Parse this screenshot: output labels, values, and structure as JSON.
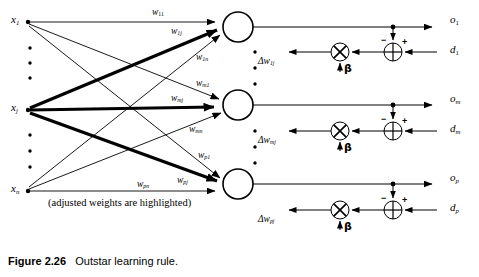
{
  "figure": {
    "number": "Figure 2.26",
    "title": "Outstar learning rule.",
    "note": "(adjusted weights are highlighted)"
  },
  "inputs": [
    {
      "name": "x1",
      "base": "x",
      "sub": "1",
      "x": 14,
      "y": 16
    },
    {
      "name": "xj",
      "base": "x",
      "sub": "j",
      "x": 14,
      "y": 104
    },
    {
      "name": "xn",
      "base": "x",
      "sub": "n",
      "x": 14,
      "y": 185
    }
  ],
  "neurons": [
    {
      "name": "neuron-1",
      "cx": 238,
      "cy": 27,
      "r": 15
    },
    {
      "name": "neuron-m",
      "cx": 238,
      "cy": 105,
      "r": 15
    },
    {
      "name": "neuron-p",
      "cx": 238,
      "cy": 184,
      "r": 15
    }
  ],
  "weights": [
    {
      "name": "w11",
      "base": "w",
      "sub": "11",
      "x": 152,
      "y": 10
    },
    {
      "name": "w1j",
      "base": "w",
      "sub": "1j",
      "x": 172,
      "y": 28
    },
    {
      "name": "w1n",
      "base": "w",
      "sub": "1n",
      "x": 196,
      "y": 54
    },
    {
      "name": "wm1",
      "base": "w",
      "sub": "m1",
      "x": 196,
      "y": 80
    },
    {
      "name": "wmj",
      "base": "w",
      "sub": "mj",
      "x": 172,
      "y": 95
    },
    {
      "name": "wmn",
      "base": "w",
      "sub": "mn",
      "x": 190,
      "y": 126
    },
    {
      "name": "wp1",
      "base": "w",
      "sub": "p1",
      "x": 198,
      "y": 152
    },
    {
      "name": "wpj",
      "base": "w",
      "sub": "pj",
      "x": 178,
      "y": 177
    },
    {
      "name": "wpn",
      "base": "w",
      "sub": "pn",
      "x": 138,
      "y": 181
    }
  ],
  "outputs": [
    {
      "name": "o1",
      "base": "o",
      "sub": "1",
      "x": 452,
      "y": 16
    },
    {
      "name": "om",
      "base": "o",
      "sub": "m",
      "x": 452,
      "y": 95
    },
    {
      "name": "op",
      "base": "o",
      "sub": "p",
      "x": 452,
      "y": 174
    }
  ],
  "desired": [
    {
      "name": "d1",
      "base": "d",
      "sub": "1",
      "x": 452,
      "y": 44
    },
    {
      "name": "dm",
      "base": "d",
      "sub": "m",
      "x": 452,
      "y": 123
    },
    {
      "name": "dp",
      "base": "d",
      "sub": "p",
      "x": 452,
      "y": 202
    }
  ],
  "delta_weights": [
    {
      "name": "dw1j",
      "prefix": "Δw",
      "sub": "1j",
      "x": 265,
      "y": 58
    },
    {
      "name": "dwmj",
      "prefix": "Δw",
      "sub": "mj",
      "x": 265,
      "y": 137
    },
    {
      "name": "dwpj",
      "prefix": "Δw",
      "sub": "pj",
      "x": 265,
      "y": 216
    }
  ],
  "learning_rates": [
    {
      "name": "beta-1",
      "symbol": "β",
      "x": 344,
      "y": 64
    },
    {
      "name": "beta-m",
      "symbol": "β",
      "x": 344,
      "y": 143
    },
    {
      "name": "beta-p",
      "symbol": "β",
      "x": 344,
      "y": 222
    }
  ],
  "summing_junctions": [
    {
      "name": "summing-junction-1",
      "cx": 393,
      "cy": 52,
      "r": 9,
      "minus": "−",
      "plus": "+"
    },
    {
      "name": "summing-junction-m",
      "cx": 393,
      "cy": 131,
      "r": 9,
      "minus": "−",
      "plus": "+"
    },
    {
      "name": "summing-junction-p",
      "cx": 393,
      "cy": 210,
      "r": 9,
      "minus": "−",
      "plus": "+"
    }
  ],
  "multipliers": [
    {
      "name": "multiplier-1",
      "cx": 340,
      "cy": 52,
      "r": 9
    },
    {
      "name": "multiplier-m",
      "cx": 340,
      "cy": 131,
      "r": 9
    },
    {
      "name": "multiplier-p",
      "cx": 340,
      "cy": 210,
      "r": 9
    }
  ],
  "colors": {
    "stroke": "#000000",
    "background": "#ffffff"
  }
}
